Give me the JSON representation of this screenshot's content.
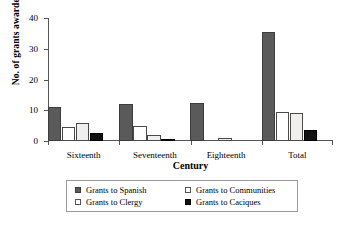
{
  "chart_data": {
    "type": "bar",
    "title": "",
    "xlabel": "Century",
    "ylabel": "No. of grants awarded",
    "categories": [
      "Sixteenth",
      "Seventeenth",
      "Eighteenth",
      "Total"
    ],
    "ylim": [
      0,
      40
    ],
    "yticks": [
      0,
      10,
      20,
      30,
      40
    ],
    "grid": false,
    "legend_position": "bottom",
    "series": [
      {
        "name": "Grants to Spanish",
        "color": "#5a5a5a",
        "values": [
          11,
          12,
          12.5,
          35.5
        ]
      },
      {
        "name": "Grants to Clergy",
        "color": "#ffffff",
        "values": [
          4.5,
          5,
          0,
          9.5
        ]
      },
      {
        "name": "Grants to Communities",
        "color": "#f0efed",
        "values": [
          6,
          2,
          1,
          9
        ]
      },
      {
        "name": "Grants to Caciques",
        "color": "#121212",
        "values": [
          2.5,
          0.7,
          0,
          3.5
        ]
      }
    ]
  },
  "legend": {
    "items": [
      {
        "label": "Grants to Spanish",
        "swatch": "spanish"
      },
      {
        "label": "Grants to Communities",
        "swatch": "communities"
      },
      {
        "label": "Grants to Clergy",
        "swatch": "clergy"
      },
      {
        "label": "Grants to Caciques",
        "swatch": "caciques"
      }
    ]
  }
}
